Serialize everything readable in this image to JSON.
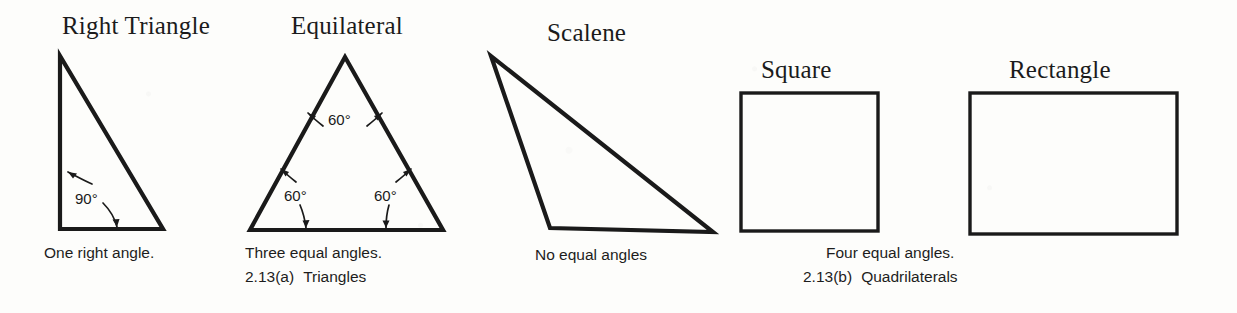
{
  "figure": {
    "shapes": [
      {
        "id": "right-triangle",
        "heading": "Right Triangle",
        "caption": "One right angle.",
        "angles": [
          "90°"
        ]
      },
      {
        "id": "equilateral-triangle",
        "heading": "Equilateral",
        "caption": "Three equal angles.",
        "angles": [
          "60°",
          "60°",
          "60°"
        ]
      },
      {
        "id": "scalene-triangle",
        "heading": "Scalene",
        "caption": "No equal angles",
        "angles": []
      },
      {
        "id": "square",
        "heading": "Square",
        "caption": "Four equal angles.",
        "angles": []
      },
      {
        "id": "rectangle",
        "heading": "Rectangle",
        "caption": "Four equal angles.",
        "angles": []
      }
    ],
    "group_captions": [
      {
        "id": "triangles",
        "number": "2.13(a)",
        "label": "Triangles"
      },
      {
        "id": "quadrilaterals",
        "number": "2.13(b)",
        "label": "Quadrilaterals"
      }
    ],
    "angle_values": {
      "right_90": "90°",
      "equilateral_top": "60°",
      "equilateral_left": "60°",
      "equilateral_right": "60°"
    },
    "colors": {
      "stroke": "#1a1a1a",
      "text": "#1d1d1d",
      "background": "#fdfdfb",
      "fill": "none"
    }
  }
}
